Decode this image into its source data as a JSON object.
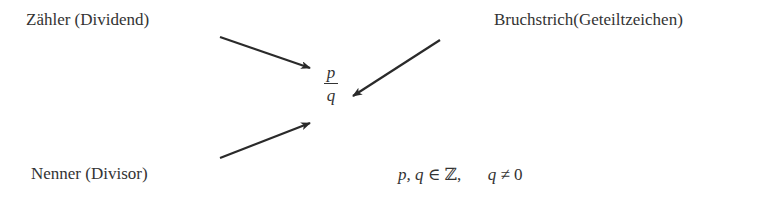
{
  "labels": {
    "numerator": "Zähler (Dividend)",
    "fraction_bar": "Bruchstrich(Geteiltzeichen)",
    "denominator": "Nenner (Divisor)"
  },
  "fraction": {
    "numerator": "p",
    "denominator": "q"
  },
  "condition": {
    "vars": "p, q",
    "element_of": "∈",
    "set": "ℤ,",
    "var": "q",
    "neq": "≠",
    "value": "0"
  },
  "arrows": [
    {
      "from": [
        220,
        37
      ],
      "to": [
        310,
        68
      ],
      "points_to": "numerator"
    },
    {
      "from": [
        440,
        40
      ],
      "to": [
        353,
        96
      ],
      "points_to": "fraction-bar"
    },
    {
      "from": [
        220,
        158
      ],
      "to": [
        310,
        123
      ],
      "points_to": "denominator"
    }
  ],
  "colors": {
    "ink": "#333333",
    "background": "#ffffff"
  }
}
